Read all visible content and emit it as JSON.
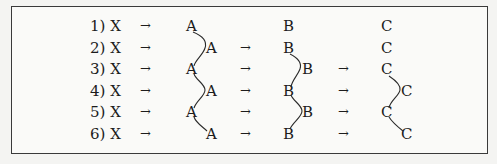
{
  "diagram": {
    "type": "reaction-pathway-table",
    "rows": [
      {
        "label": "1) X",
        "arrow1": "→",
        "a": {
          "text": "A",
          "pos": "left"
        },
        "arrow2": "",
        "b": {
          "text": "B",
          "pos": "left"
        },
        "arrow3": "",
        "c": {
          "text": "C",
          "pos": "left"
        }
      },
      {
        "label": "2) X",
        "arrow1": "→",
        "a": {
          "text": "A",
          "pos": "right"
        },
        "arrow2": "→",
        "b": {
          "text": "B",
          "pos": "left"
        },
        "arrow3": "",
        "c": {
          "text": "C",
          "pos": "left"
        }
      },
      {
        "label": "3) X",
        "arrow1": "→",
        "a": {
          "text": "A",
          "pos": "left"
        },
        "arrow2": "→",
        "b": {
          "text": "B",
          "pos": "right"
        },
        "arrow3": "→",
        "c": {
          "text": "C",
          "pos": "left"
        }
      },
      {
        "label": "4) X",
        "arrow1": "→",
        "a": {
          "text": "A",
          "pos": "right"
        },
        "arrow2": "→",
        "b": {
          "text": "B",
          "pos": "left"
        },
        "arrow3": "→",
        "c": {
          "text": "C",
          "pos": "right"
        }
      },
      {
        "label": "5) X",
        "arrow1": "→",
        "a": {
          "text": "A",
          "pos": "left"
        },
        "arrow2": "→",
        "b": {
          "text": "B",
          "pos": "right"
        },
        "arrow3": "→",
        "c": {
          "text": "C",
          "pos": "left"
        }
      },
      {
        "label": "6) X",
        "arrow1": "→",
        "a": {
          "text": "A",
          "pos": "right"
        },
        "arrow2": "→",
        "b": {
          "text": "B",
          "pos": "left"
        },
        "arrow3": "→",
        "c": {
          "text": "C",
          "pos": "right"
        }
      }
    ],
    "connectors": [
      {
        "column": "A",
        "from_row": 1,
        "to_row": 6,
        "shape": "zigzag-wave"
      },
      {
        "column": "B",
        "from_row": 2,
        "to_row": 6,
        "shape": "zigzag-wave"
      },
      {
        "column": "C",
        "from_row": 3,
        "to_row": 6,
        "shape": "zigzag-wave"
      }
    ],
    "colors": {
      "frame": "#3a3a3a",
      "text": "#1c1c1c",
      "background": "#f4f4f2"
    }
  }
}
